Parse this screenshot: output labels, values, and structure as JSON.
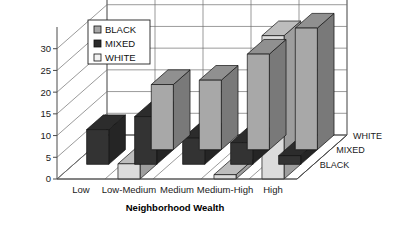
{
  "chart_data": {
    "type": "bar",
    "title": "",
    "subtitle": "",
    "xlabel": "Neighborhood Wealth",
    "ylabel": "",
    "categories": [
      "Low",
      "Low-Medium",
      "Medium",
      "Medium-High",
      "High"
    ],
    "series": [
      {
        "name": "BLACK",
        "values": [
          0,
          15,
          16,
          22,
          28
        ]
      },
      {
        "name": "MIXED",
        "values": [
          8,
          11,
          6,
          5,
          2
        ]
      },
      {
        "name": "WHITE",
        "values": [
          0,
          3.5,
          0,
          1,
          33
        ]
      }
    ],
    "depth_axis_labels": [
      "WHITE",
      "MIXED",
      "BLACK"
    ],
    "yticks": [
      0,
      5,
      10,
      15,
      20,
      25,
      30
    ],
    "ylim": [
      0,
      35
    ],
    "grid": true,
    "legend_position": "top-left",
    "three_d": true,
    "series_colors": {
      "BLACK": "#a8a8a8",
      "MIXED": "#333333",
      "WHITE": "#dcdcdc"
    }
  },
  "legend": {
    "items": [
      {
        "label": "BLACK",
        "swatch": "#a8a8a8"
      },
      {
        "label": "MIXED",
        "swatch": "#2b2b2b"
      },
      {
        "label": "WHITE",
        "swatch": "#f2f2f2"
      }
    ]
  }
}
